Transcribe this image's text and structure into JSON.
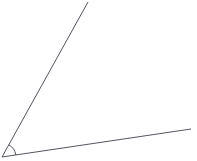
{
  "figure": {
    "kind": "geometry-angle-diagram",
    "title": "Angle formed by two rays",
    "width": 197,
    "height": 161,
    "background_color": "#ffffff",
    "stroke_color": "#555560",
    "stroke_width": 1,
    "vertex": {
      "label": "",
      "x": 2,
      "y": 157
    },
    "rays": [
      {
        "name": "upper-ray",
        "description": "steep ray rising to the upper right",
        "x1": 2,
        "y1": 157,
        "x2": 88,
        "y2": 2,
        "angle_degrees": 61,
        "length_px": 177
      },
      {
        "name": "lower-ray",
        "description": "shallow ray extending to the right",
        "x1": 2,
        "y1": 157,
        "x2": 191,
        "y2": 129,
        "angle_degrees": 8,
        "length_px": 191
      }
    ],
    "angle_mark": {
      "name": "angle-arc",
      "label": "",
      "radius_px": 14,
      "start_angle_degrees": 8,
      "end_angle_degrees": 61,
      "measure_degrees": 53,
      "path": "M 15.86 155.05 A 14 14 0 0 0 8.79 144.75"
    }
  }
}
